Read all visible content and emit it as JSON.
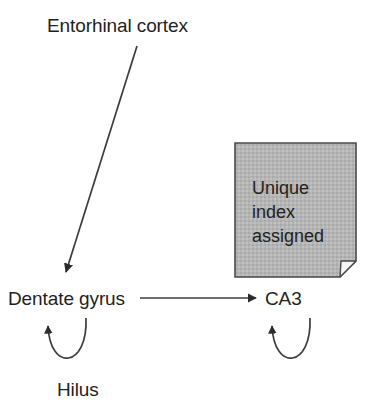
{
  "diagram": {
    "nodes": {
      "entorhinal_cortex": "Entorhinal cortex",
      "dentate_gyrus": "Dentate gyrus",
      "ca3": "CA3",
      "hilus": "Hilus"
    },
    "note": {
      "lines": [
        "Unique",
        "index",
        "assigned"
      ],
      "line1": "Unique",
      "line2": "index",
      "line3": "assigned",
      "fill_color": "#b5b5b5",
      "border_color": "#4a4a4a",
      "fold_color": "#f2f2f2"
    },
    "connectors": [
      {
        "name": "entorhinal-to-dentate-arrow",
        "from": "Entorhinal cortex",
        "to": "Dentate gyrus",
        "style": "diagonal-arrow"
      },
      {
        "name": "dentate-to-ca3-arrow",
        "from": "Dentate gyrus",
        "to": "CA3",
        "style": "horizontal-arrow"
      },
      {
        "name": "dentate-hilus-loop",
        "from": "Dentate gyrus",
        "to": "Dentate gyrus",
        "via": "Hilus",
        "style": "recurrent-loop"
      },
      {
        "name": "ca3-recurrent-loop",
        "from": "CA3",
        "to": "CA3",
        "style": "recurrent-loop"
      }
    ],
    "stroke_color": "#3c3c3c",
    "text_color": "#231f20",
    "background_color": "#ffffff"
  }
}
